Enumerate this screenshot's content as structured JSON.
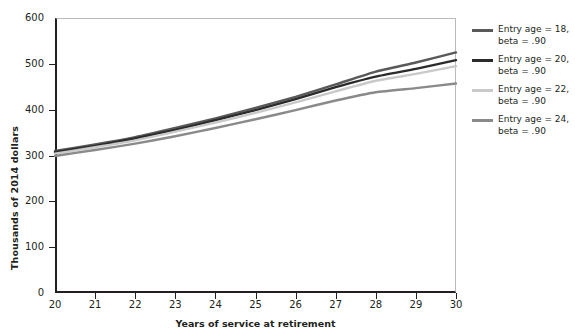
{
  "chart_data": {
    "type": "line",
    "title": "",
    "xlabel": "Years of service at retirement",
    "ylabel": "Thousands of 2014 dollars",
    "xlim": [
      20,
      30
    ],
    "ylim": [
      0,
      600
    ],
    "grid": false,
    "legend_position": "right",
    "x": [
      20,
      21,
      22,
      23,
      24,
      25,
      26,
      27,
      28,
      29,
      30
    ],
    "xticks": [
      "20",
      "21",
      "22",
      "23",
      "24",
      "25",
      "26",
      "27",
      "28",
      "29",
      "30"
    ],
    "yticks": [
      "0",
      "100",
      "200",
      "300",
      "400",
      "500",
      "600"
    ],
    "series": [
      {
        "name": "Entry age = 18,\nbeta = .90",
        "color": "#595959",
        "values": [
          310,
          324,
          340,
          360,
          381,
          404,
          428,
          455,
          483,
          503,
          525
        ]
      },
      {
        "name": "Entry age = 20,\nbeta = .90",
        "color": "#2b2b2b",
        "values": [
          307,
          321,
          337,
          356,
          377,
          399,
          423,
          449,
          472,
          489,
          508
        ]
      },
      {
        "name": "Entry age = 22,\nbeta = .90",
        "color": "#c9c9c9",
        "values": [
          304,
          318,
          333,
          352,
          372,
          393,
          416,
          440,
          463,
          478,
          495
        ]
      },
      {
        "name": "Entry age = 24,\nbeta = .90",
        "color": "#8a8a8a",
        "values": [
          299,
          312,
          326,
          342,
          360,
          379,
          399,
          420,
          438,
          447,
          457
        ]
      }
    ]
  },
  "legend": {
    "items": [
      {
        "label": "Entry age = 18,\nbeta = .90",
        "color": "#595959"
      },
      {
        "label": "Entry age = 20,\nbeta = .90",
        "color": "#2b2b2b"
      },
      {
        "label": "Entry age = 22,\nbeta = .90",
        "color": "#c9c9c9"
      },
      {
        "label": "Entry age = 24,\nbeta = .90",
        "color": "#8a8a8a"
      }
    ]
  },
  "axes": {
    "y_title": "Thousands of 2014 dollars",
    "x_title": "Years of service at retirement"
  }
}
